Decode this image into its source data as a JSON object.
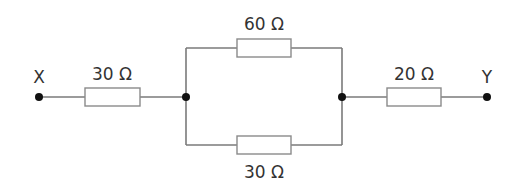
{
  "diagram": {
    "type": "circuit",
    "terminals": [
      {
        "id": "X",
        "label": "X"
      },
      {
        "id": "Y",
        "label": "Y"
      }
    ],
    "resistors": [
      {
        "id": "R1",
        "label": "30 Ω",
        "value_ohms": 30,
        "position": "series-left"
      },
      {
        "id": "R2",
        "label": "60 Ω",
        "value_ohms": 60,
        "position": "parallel-top"
      },
      {
        "id": "R3",
        "label": "30 Ω",
        "value_ohms": 30,
        "position": "parallel-bottom"
      },
      {
        "id": "R4",
        "label": "20 Ω",
        "value_ohms": 20,
        "position": "series-right"
      }
    ],
    "colors": {
      "wire": "#7a7a7a",
      "node": "#111111",
      "text": "#333333"
    }
  }
}
